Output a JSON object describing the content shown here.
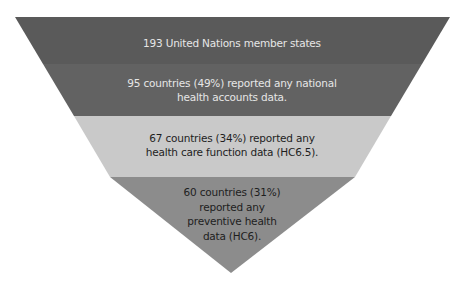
{
  "diagram": {
    "type": "funnel",
    "tiers": [
      {
        "label": "193 United Nations member states",
        "fill": "#5a5a5a",
        "text_color": "#e6e6e6"
      },
      {
        "label_lines": [
          "95 countries (49%) reported any national",
          "health accounts data."
        ],
        "fill": "#626262",
        "text_color": "#e6e6e6"
      },
      {
        "label_lines": [
          "67 countries (34%) reported any",
          "health care function data (HC6.5)."
        ],
        "fill": "#c9c9c9",
        "text_color": "#1e1e1e"
      },
      {
        "label_lines": [
          "60 countries (31%)",
          "reported any",
          "preventive health",
          "data (HC6)."
        ],
        "fill": "#8c8c8c",
        "text_color": "#1e1e1e"
      }
    ]
  }
}
